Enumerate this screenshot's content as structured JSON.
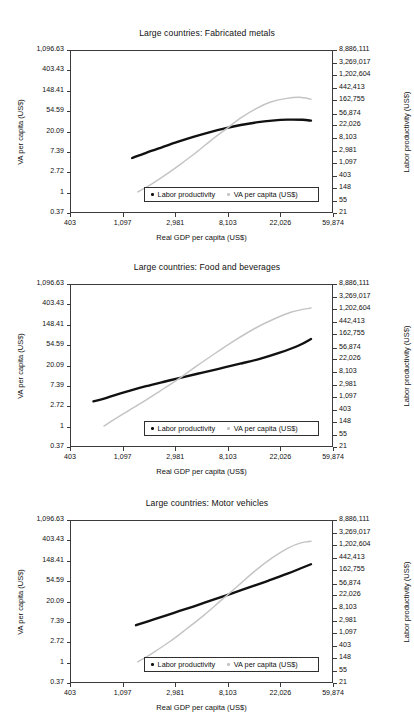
{
  "figure": {
    "axis_title_x": "Real GDP per capita (US$)",
    "axis_title_left": "VA per capita (US$)",
    "axis_title_right": "Labor productivity (US$)",
    "series_colors": {
      "labor_productivity": "#111111",
      "va_per_capita": "#c4c4c4"
    },
    "legend": {
      "labor_productivity_label": "Labor productivity",
      "va_per_capita_label": "VA per capita (US$)"
    }
  },
  "chart_data": [
    {
      "type": "line",
      "title": "Large countries: Fabricated metals",
      "xlabel": "Real GDP per capita (US$)",
      "ylabel": "VA per capita (US$)",
      "ylabel_right": "Labor productivity (US$)",
      "xscale": "log",
      "yscale": "log",
      "grid": false,
      "legend_position": "bottom-center",
      "xlim": [
        403,
        59874
      ],
      "xticks": [
        403,
        1097,
        2981,
        8103,
        22026,
        59874
      ],
      "xticklabels": [
        "403",
        "1,097",
        "2,981",
        "8,103",
        "22,026",
        "59,874"
      ],
      "ylim": [
        0.37,
        1096.63
      ],
      "yticks": [
        0.37,
        1,
        2.72,
        7.39,
        20.09,
        54.59,
        148.41,
        403.43,
        1096.63
      ],
      "yticklabels": [
        "0.37",
        "1",
        "2.72",
        "7.39",
        "20.09",
        "54.59",
        "148.41",
        "403.43",
        "1,096.63"
      ],
      "ylim_right": [
        21,
        8886111
      ],
      "yticks_right": [
        21,
        55,
        148,
        403,
        1097,
        2981,
        8103,
        22026,
        56874,
        162755,
        442413,
        1202604,
        3269017,
        8886111
      ],
      "yticklabels_right": [
        "21",
        "55",
        "148",
        "403",
        "1,097",
        "2,981",
        "8,103",
        "22,026",
        "56,874",
        "162,755",
        "442,413",
        "1,202,604",
        "3,269,017",
        "8,886,111"
      ],
      "series": [
        {
          "name": "Labor productivity",
          "color": "#111111",
          "x": [
            1300,
            1700,
            2300,
            3100,
            4200,
            5700,
            7700,
            10400,
            14000,
            19000,
            25500,
            34000,
            40000
          ],
          "y": [
            5.4,
            7.0,
            9.2,
            12.0,
            15.4,
            19.3,
            23.5,
            27.8,
            31.6,
            34.6,
            36.3,
            36.0,
            34.5
          ]
        },
        {
          "name": "VA per capita (US$)",
          "color": "#c4c4c4",
          "x": [
            1450,
            1900,
            2500,
            3300,
            4400,
            5900,
            7900,
            10500,
            14000,
            18500,
            24500,
            32000,
            40000
          ],
          "y": [
            1.0,
            1.5,
            2.4,
            4.0,
            7.0,
            13.0,
            23.0,
            40.0,
            63.0,
            87.0,
            103.0,
            110.0,
            100.0
          ]
        }
      ]
    },
    {
      "type": "line",
      "title": "Large countries: Food and beverages",
      "xlabel": "Real GDP per capita (US$)",
      "ylabel": "VA per capita (US$)",
      "ylabel_right": "Labor productivity (US$)",
      "xscale": "log",
      "yscale": "log",
      "grid": false,
      "legend_position": "bottom-center",
      "xlim": [
        403,
        59874
      ],
      "xticks": [
        403,
        1097,
        2981,
        8103,
        22026,
        59874
      ],
      "xticklabels": [
        "403",
        "1,097",
        "2,981",
        "8,103",
        "22,026",
        "59,874"
      ],
      "ylim": [
        0.37,
        1096.63
      ],
      "yticks": [
        0.37,
        1,
        2.72,
        7.39,
        20.09,
        54.59,
        148.41,
        403.43,
        1096.63
      ],
      "yticklabels": [
        "0.37",
        "1",
        "2.72",
        "7.39",
        "20.09",
        "54.59",
        "148.41",
        "403.43",
        "1,096.63"
      ],
      "ylim_right": [
        21,
        8886111
      ],
      "yticks_right": [
        21,
        55,
        148,
        403,
        1097,
        2981,
        8103,
        22026,
        56874,
        162755,
        442413,
        1202604,
        3269017,
        8886111
      ],
      "yticklabels_right": [
        "21",
        "55",
        "148",
        "403",
        "1,097",
        "2,981",
        "8,103",
        "22,026",
        "56,874",
        "162,755",
        "442,413",
        "1,202,604",
        "3,269,017",
        "8,886,111"
      ],
      "series": [
        {
          "name": "Labor productivity",
          "color": "#111111",
          "x": [
            620,
            760,
            950,
            1250,
            1700,
            2400,
            3400,
            4900,
            7100,
            10300,
            15000,
            22000,
            32000,
            40000
          ],
          "y": [
            3.4,
            3.9,
            4.7,
            5.8,
            7.2,
            9.0,
            11.2,
            14.0,
            17.5,
            22.0,
            28.0,
            38.0,
            55.0,
            75.0
          ]
        },
        {
          "name": "VA per capita (US$)",
          "color": "#c4c4c4",
          "x": [
            760,
            930,
            1200,
            1600,
            2200,
            3100,
            4400,
            6400,
            9300,
            13500,
            19500,
            28000,
            40000
          ],
          "y": [
            1.0,
            1.4,
            2.1,
            3.3,
            5.6,
            10.0,
            19.0,
            37.0,
            70.0,
            125.0,
            200.0,
            290.0,
            350.0
          ]
        }
      ]
    },
    {
      "type": "line",
      "title": "Large countries: Motor vehicles",
      "xlabel": "Real GDP per capita (US$)",
      "ylabel": "VA per capita (US$)",
      "ylabel_right": "Labor productivity (US$)",
      "xscale": "log",
      "yscale": "log",
      "grid": false,
      "legend_position": "bottom-center",
      "xlim": [
        403,
        59874
      ],
      "xticks": [
        403,
        1097,
        2981,
        8103,
        22026,
        59874
      ],
      "xticklabels": [
        "403",
        "1,097",
        "2,981",
        "8,103",
        "22,026",
        "59,874"
      ],
      "ylim": [
        0.37,
        1096.63
      ],
      "yticks": [
        0.37,
        1,
        2.72,
        7.39,
        20.09,
        54.59,
        148.41,
        403.43,
        1096.63
      ],
      "yticklabels": [
        "0.37",
        "1",
        "2.72",
        "7.39",
        "20.09",
        "54.59",
        "148.41",
        "403.43",
        "1,096.63"
      ],
      "ylim_right": [
        21,
        8886111
      ],
      "yticks_right": [
        21,
        55,
        148,
        403,
        1097,
        2981,
        8103,
        22026,
        56874,
        162755,
        442413,
        1202604,
        3269017,
        8886111
      ],
      "yticklabels_right": [
        "21",
        "55",
        "148",
        "403",
        "1,097",
        "2,981",
        "8,103",
        "22,026",
        "56,874",
        "162,755",
        "442,413",
        "1,202,604",
        "3,269,017",
        "8,886,111"
      ],
      "series": [
        {
          "name": "Labor productivity",
          "color": "#111111",
          "x": [
            1400,
            2000,
            2900,
            4200,
            6000,
            8600,
            12400,
            17800,
            25500,
            33000,
            40000
          ],
          "y": [
            6.2,
            8.4,
            11.5,
            15.7,
            21.5,
            29.5,
            41.0,
            57.0,
            80.0,
            105.0,
            128.0
          ]
        },
        {
          "name": "VA per capita (US$)",
          "color": "#c4c4c4",
          "x": [
            1450,
            1950,
            2700,
            3700,
            5100,
            7100,
            9900,
            13700,
            19000,
            26000,
            33000,
            40000
          ],
          "y": [
            1.0,
            1.6,
            2.8,
            5.2,
            10.0,
            21.0,
            44.0,
            92.0,
            175.0,
            290.0,
            370.0,
            400.0
          ]
        }
      ]
    }
  ]
}
